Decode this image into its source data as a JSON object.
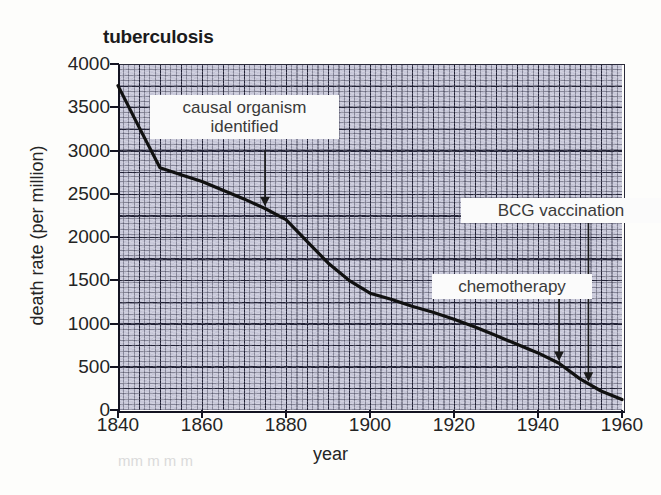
{
  "figure": {
    "title": "tuberculosis",
    "background": "#fdfdfb",
    "plot_bg": "#c9c9da",
    "line_color": "#111111",
    "faint_cut_text": "mm m m   m"
  },
  "chart_data": {
    "type": "line",
    "title": "tuberculosis",
    "xlabel": "year",
    "ylabel": "death rate (per million)",
    "xlim": [
      1840,
      1960
    ],
    "ylim": [
      0,
      4000
    ],
    "grid": true,
    "legend": "none",
    "xticks": [
      1840,
      1860,
      1880,
      1900,
      1920,
      1940,
      1960
    ],
    "yticks": [
      0,
      500,
      1000,
      1500,
      2000,
      2500,
      3000,
      3500,
      4000
    ],
    "series": [
      {
        "name": "tuberculosis death rate",
        "x": [
          1840,
          1845,
          1850,
          1855,
          1860,
          1865,
          1870,
          1875,
          1880,
          1885,
          1890,
          1895,
          1900,
          1905,
          1910,
          1915,
          1920,
          1925,
          1930,
          1935,
          1940,
          1945,
          1950,
          1955,
          1960
        ],
        "values": [
          3750,
          3270,
          2800,
          2720,
          2640,
          2540,
          2440,
          2330,
          2200,
          1950,
          1700,
          1500,
          1350,
          1280,
          1200,
          1130,
          1050,
          960,
          860,
          760,
          660,
          540,
          360,
          220,
          120
        ]
      }
    ],
    "annotations": [
      {
        "label": "causal organism\nidentified",
        "points_to_year": 1875,
        "points_to_value": 2330
      },
      {
        "label": "BCG vaccination",
        "points_to_year": 1952,
        "points_to_value": 300
      },
      {
        "label": "chemotherapy",
        "points_to_year": 1945,
        "points_to_value": 540
      }
    ]
  },
  "axes": {
    "y_title": "death rate (per million)",
    "x_title": "year",
    "y_labels": [
      "4000",
      "3500",
      "3000",
      "2500",
      "2000",
      "1500",
      "1000",
      "500",
      "0"
    ],
    "x_labels": [
      "1840",
      "1860",
      "1880",
      "1900",
      "1920",
      "1940",
      "1960"
    ]
  },
  "annotations": {
    "causal": "causal organism\nidentified",
    "bcg": "BCG vaccination",
    "chemo": "chemotherapy"
  }
}
